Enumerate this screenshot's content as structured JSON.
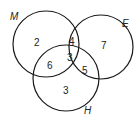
{
  "diagram": {
    "type": "venn",
    "sets": [
      {
        "id": "M",
        "label": "M",
        "cx": 46,
        "cy": 44,
        "r": 33,
        "label_x": 10,
        "label_y": 20
      },
      {
        "id": "E",
        "label": "E",
        "cx": 101,
        "cy": 47,
        "r": 32,
        "label_x": 122,
        "label_y": 27
      },
      {
        "id": "H",
        "label": "H",
        "cx": 66,
        "cy": 78,
        "r": 33,
        "label_x": 84,
        "label_y": 114
      }
    ],
    "regions": [
      {
        "name": "M-only",
        "value": "2",
        "x": 37,
        "y": 42
      },
      {
        "name": "M-and-E-only",
        "value": "4",
        "x": 72,
        "y": 42
      },
      {
        "name": "E-only",
        "value": "7",
        "x": 104,
        "y": 47
      },
      {
        "name": "M-and-H-only",
        "value": "6",
        "x": 50,
        "y": 66
      },
      {
        "name": "M-E-H",
        "value": "3",
        "x": 70,
        "y": 59
      },
      {
        "name": "E-and-H-only",
        "value": "5",
        "x": 85,
        "y": 71
      },
      {
        "name": "H-only",
        "value": "3",
        "x": 66,
        "y": 92
      }
    ]
  }
}
